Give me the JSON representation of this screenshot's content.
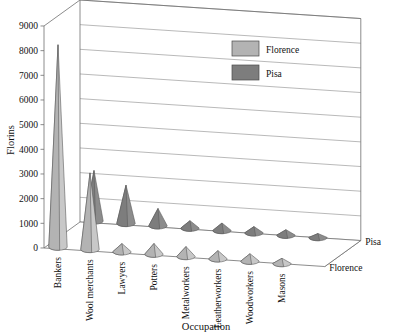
{
  "chart_data": {
    "type": "bar",
    "render_style": "3d-cone",
    "title": "",
    "xlabel": "Occupation",
    "ylabel": "Florins",
    "zlabel": "",
    "categories": [
      "Bankers",
      "Wool merchants",
      "Lawyers",
      "Potters",
      "Metalworkers",
      "Leatherworkers",
      "Woodworkers",
      "Masons"
    ],
    "series": [
      {
        "name": "Florence",
        "color": "#b3b3b3",
        "values": [
          8200,
          3100,
          330,
          430,
          400,
          330,
          300,
          210
        ]
      },
      {
        "name": "Pisa",
        "color": "#7d7d7d",
        "values": [
          2050,
          1550,
          700,
          300,
          300,
          250,
          220,
          160
        ]
      }
    ],
    "depth_axis_labels": [
      "Pisa",
      "Florence"
    ],
    "ylim": [
      0,
      9000
    ],
    "ytick_values": [
      0,
      1000,
      2000,
      3000,
      4000,
      5000,
      6000,
      7000,
      8000,
      9000
    ],
    "ytick_labels": [
      "0",
      "1000",
      "2000",
      "3000",
      "4000",
      "5000",
      "6000",
      "7000",
      "8000",
      "9000"
    ],
    "grid": true,
    "legend": {
      "position": "top-right-inside",
      "entries": [
        {
          "label": "Florence",
          "color": "#b3b3b3"
        },
        {
          "label": "Pisa",
          "color": "#7d7d7d"
        }
      ]
    }
  }
}
